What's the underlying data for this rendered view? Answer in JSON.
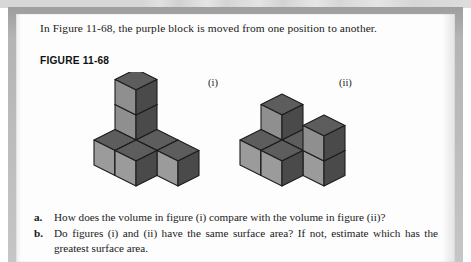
{
  "page": {
    "intro_text": "In Figure 11-68, the purple block is moved from one position to another.",
    "figure_caption": "FIGURE 11-68"
  },
  "figure": {
    "label_i": "(i)",
    "label_ii": "(ii)",
    "colors": {
      "top_face": "#5d5d5d",
      "front_face": "#8f8f8f",
      "front_face_light": "#9b9b9b",
      "side_face": "#4a4a4a",
      "outline": "#1c1c1c"
    },
    "diagram_type": "isometric-unit-cube-stack",
    "cube_count_i": 7,
    "cube_count_ii": 7
  },
  "questions": [
    {
      "marker": "a.",
      "text": "How does the volume in figure (i) compare with the volume in figure (ii)?"
    },
    {
      "marker": "b.",
      "text": "Do figures (i) and (ii) have the same surface area? If not, estimate which has the greatest surface area."
    }
  ]
}
